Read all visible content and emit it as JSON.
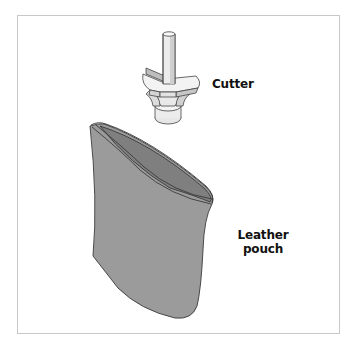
{
  "diagram": {
    "labels": {
      "cutter": "Cutter",
      "pouch_line1": "Leather",
      "pouch_line2": "pouch"
    },
    "colors": {
      "frame_border": "#c8c8c8",
      "pouch_fill": "#9a9a9a",
      "pouch_inner": "#7e7e7e",
      "outline": "#333333",
      "cutter_light": "#f2f2f2",
      "cutter_mid": "#d6d6d6",
      "cutter_dark": "#b0b0b0"
    }
  }
}
